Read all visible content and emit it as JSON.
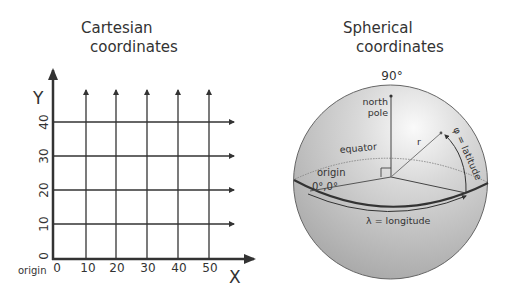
{
  "cartesian": {
    "title_line1": "Cartesian",
    "title_line2": "coordinates",
    "y_label": "Y",
    "x_label": "X",
    "origin_label": "origin",
    "x_ticks": [
      "0",
      "10",
      "20",
      "30",
      "40",
      "50"
    ],
    "y_ticks": [
      "0",
      "10",
      "20",
      "30",
      "40"
    ]
  },
  "spherical": {
    "title_line1": "Spherical",
    "title_line2": "coordinates",
    "top_angle": "90°",
    "north_pole_line1": "north",
    "north_pole_line2": "pole",
    "equator_label": "equator",
    "radius_label": "r",
    "latitude_label": "φ = latitude",
    "longitude_label": "λ = longitude",
    "origin_label": "origin",
    "origin_coords": "0°,0°"
  },
  "colors": {
    "ink": "#333333",
    "sphere_light": "#f4f4f4",
    "sphere_dark": "#a9a9a9"
  }
}
